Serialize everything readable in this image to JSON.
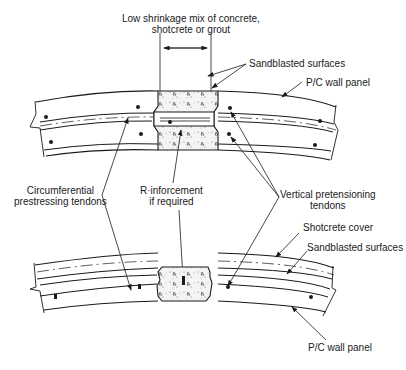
{
  "labels": {
    "joint_mix_line1": "Low shrinkage mix of concrete,",
    "joint_mix_line2": "shotcrete or grout",
    "sandblasted_top": "Sandblasted surfaces",
    "wall_panel_top": "P/C wall panel",
    "circ_tendons_line1": "Circumferential",
    "circ_tendons_line2": "prestressing tendons",
    "reinforcement_line1": "R·inforcement",
    "reinforcement_line2": "if required",
    "vertical_tendons_line1": "Vertical pretensioning",
    "vertical_tendons_line2": "tendons",
    "shotcrete_cover": "Shotcrete cover",
    "sandblasted_bottom": "Sandblasted surfaces",
    "wall_panel_bottom": "P/C wall panel"
  },
  "colors": {
    "line": "#1a1a1a",
    "fill": "#f2f2f2",
    "background": "#ffffff"
  }
}
